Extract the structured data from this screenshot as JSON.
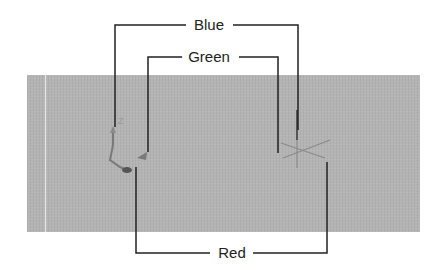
{
  "diagram": {
    "title": "",
    "viewport": {
      "background": "#b4b4b4"
    },
    "callouts": [
      {
        "id": "blue",
        "label": "Blue",
        "color": "#222222"
      },
      {
        "id": "green",
        "label": "Green",
        "color": "#222222"
      },
      {
        "id": "red",
        "label": "Red",
        "color": "#222222"
      }
    ],
    "ucs_icon": {
      "axis_label": "Z"
    },
    "crosshair": {
      "present": true
    }
  }
}
